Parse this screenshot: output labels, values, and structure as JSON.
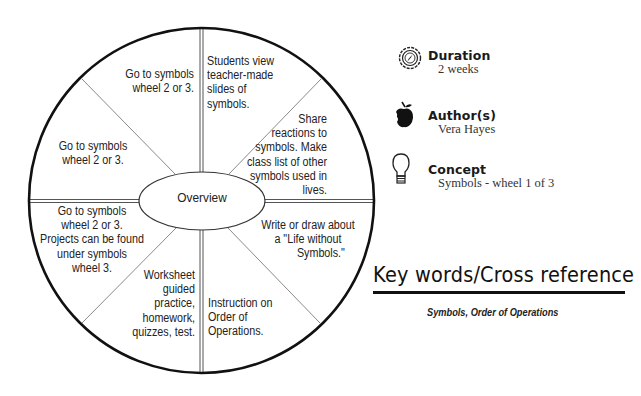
{
  "wheel": {
    "title": "Symbols - wheel 1 of 3",
    "center_label": "Overview",
    "segments": {
      "top_left": [
        "Go to symbols",
        "wheel 2 or 3."
      ],
      "top_right": [
        "Students view",
        "teacher-made",
        "slides of",
        "symbols."
      ],
      "right_upper": [
        "Share",
        "reactions to",
        "symbols.  Make",
        "class list of other",
        "symbols used in",
        "lives."
      ],
      "right_lower": [
        "Write or draw about",
        "a \"Life without",
        "Symbols.\""
      ],
      "bottom_right": [
        "Instruction on",
        "Order of",
        "Operations."
      ],
      "bottom_left": [
        "Worksheet",
        "guided",
        "practice,",
        "homework,",
        "quizzes, test."
      ],
      "left_lower": [
        "Go to symbols",
        "wheel 2 or 3.",
        "Projects can be found",
        "under symbols",
        "wheel 3."
      ],
      "left_upper": [
        "Go to symbols",
        "wheel 2 or 3."
      ]
    }
  },
  "info": {
    "duration": {
      "icon": "compass-icon",
      "label": "Duration",
      "value": "2 weeks"
    },
    "authors": {
      "icon": "apple-icon",
      "label": "Author(s)",
      "value": "Vera Hayes"
    },
    "concept": {
      "icon": "light-bulb-icon",
      "label": "Concept",
      "value": "Symbols - wheel 1 of 3"
    }
  },
  "keywords": {
    "heading": "Key words/Cross reference",
    "text": "Symbols, Order of Operations"
  },
  "colors": {
    "ink": "#111111",
    "divider": "#888888",
    "background": "#ffffff"
  }
}
